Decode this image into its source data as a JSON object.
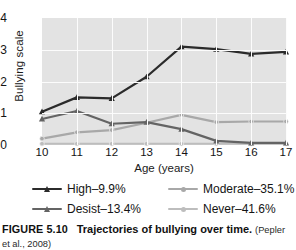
{
  "figure": {
    "number_label": "FIGURE 5.10",
    "title": "Trajectories of bullying over time.",
    "citation": "(Pepler et al., 2008)"
  },
  "legend": {
    "position": "below-axes",
    "items": [
      {
        "label": "High–9.9%",
        "color": "#2b2b2b",
        "marker": "triangle"
      },
      {
        "label": "Moderate–35.1%",
        "color": "#a8a8a8",
        "marker": "circle"
      },
      {
        "label": "Desist–13.4%",
        "color": "#646464",
        "marker": "triangle"
      },
      {
        "label": "Never–41.6%",
        "color": "#bdbdbd",
        "marker": "circle"
      }
    ]
  },
  "chart_data": {
    "type": "line",
    "title": "Trajectories of bullying over time.",
    "xlabel": "Age (years)",
    "ylabel": "Bullying scale",
    "x": [
      10,
      11,
      12,
      13,
      14,
      15,
      16,
      17
    ],
    "categories": [
      "10",
      "11",
      "12",
      "13",
      "14",
      "15",
      "16",
      "17"
    ],
    "xtick_labels": [
      "10",
      "11",
      "12",
      "13",
      "14",
      "15",
      "16",
      "17"
    ],
    "ytick_labels": [
      "0",
      "1",
      "2",
      "3",
      "4"
    ],
    "yticks": [
      0,
      1,
      2,
      3,
      4
    ],
    "xlim": [
      10,
      17
    ],
    "ylim": [
      0,
      4
    ],
    "grid": "white gridlines on gray panel",
    "plot_background": "#e3e3e3",
    "gridline_color": "#fcfcfc",
    "series": [
      {
        "name": "High–9.9%",
        "color": "#2b2b2b",
        "marker": "triangle",
        "values": [
          1.05,
          1.5,
          1.47,
          2.15,
          3.1,
          3.02,
          2.87,
          2.93
        ]
      },
      {
        "name": "Desist–13.4%",
        "color": "#646464",
        "marker": "triangle",
        "values": [
          0.82,
          1.07,
          0.67,
          0.72,
          0.5,
          0.13,
          0.07,
          0.07
        ]
      },
      {
        "name": "Moderate–35.1%",
        "color": "#a8a8a8",
        "marker": "circle",
        "values": [
          0.2,
          0.4,
          0.47,
          0.7,
          0.95,
          0.72,
          0.74,
          0.74
        ]
      },
      {
        "name": "Never–41.6%",
        "color": "#bdbdbd",
        "marker": "circle",
        "values": [
          0.04,
          0.04,
          0.04,
          0.04,
          0.04,
          0.04,
          0.04,
          0.04
        ]
      }
    ]
  }
}
